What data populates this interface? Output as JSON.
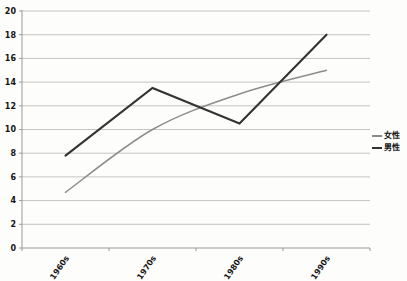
{
  "chart_data": {
    "type": "line",
    "title": "",
    "xlabel": "",
    "ylabel": "",
    "categories": [
      "1960s",
      "1970s",
      "1980s",
      "1990s"
    ],
    "series": [
      {
        "name": "女性",
        "values": [
          4.7,
          10,
          13,
          15
        ],
        "color": "#8c8c8c",
        "smooth": true,
        "stroke_width": 1.5
      },
      {
        "name": "男性",
        "values": [
          7.8,
          13.5,
          10.5,
          18
        ],
        "color": "#333333",
        "smooth": false,
        "stroke_width": 2.1
      }
    ],
    "ylim": [
      0,
      20
    ],
    "yticks": [
      0,
      2,
      4,
      6,
      8,
      10,
      12,
      14,
      16,
      18,
      20
    ],
    "grid": "horizontal",
    "legend_position": "right",
    "x_label_rotation_deg": -55
  },
  "colors": {
    "background": "#fdfdfc",
    "gridline": "#c4c4c2",
    "axis": "#9b9b99",
    "tick_label": "#141414"
  }
}
